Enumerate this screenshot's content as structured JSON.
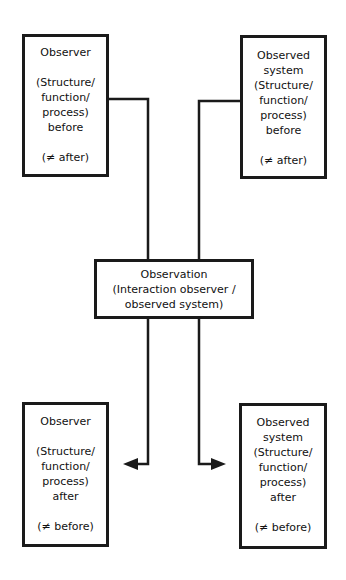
{
  "diagram": {
    "boxes": {
      "observer_before": {
        "title": [
          "Observer"
        ],
        "body": [
          "(Structure/",
          "function/",
          "process)",
          "before"
        ],
        "note": "(≠ after)"
      },
      "observed_before": {
        "title": [
          "Observed",
          "system"
        ],
        "body": [
          "(Structure/",
          "function/",
          "process)",
          "before"
        ],
        "note": "(≠ after)"
      },
      "observation": {
        "lines": [
          "Observation",
          "(Interaction observer /",
          "observed system)"
        ]
      },
      "observer_after": {
        "title": [
          "Observer"
        ],
        "body": [
          "(Structure/",
          "function/",
          "process)",
          "after"
        ],
        "note": "(≠ before)"
      },
      "observed_after": {
        "title": [
          "Observed",
          "system"
        ],
        "body": [
          "(Structure/",
          "function/",
          "process)",
          "after"
        ],
        "note": "(≠ before)"
      }
    },
    "colors": {
      "line": "#1a1a1a",
      "background": "#ffffff"
    }
  }
}
